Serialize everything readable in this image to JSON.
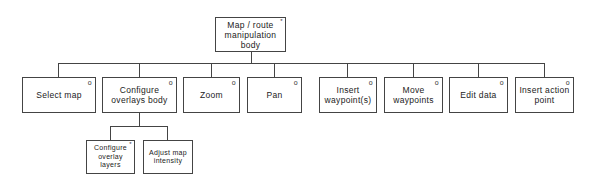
{
  "diagram": {
    "type": "hierarchy-tree",
    "root": {
      "label": "Map / route manipulation body",
      "marker": "*"
    },
    "children": [
      {
        "label": "Select map",
        "marker": "o"
      },
      {
        "label": "Configure overlays body",
        "marker": "o",
        "children": [
          {
            "label": "Configure overlay layers",
            "marker": "*"
          },
          {
            "label": "Adjust map intensity",
            "marker": ""
          }
        ]
      },
      {
        "label": "Zoom",
        "marker": "o"
      },
      {
        "label": "Pan",
        "marker": "o"
      },
      {
        "label": "Insert waypoint(s)",
        "marker": "o"
      },
      {
        "label": "Move waypoints",
        "marker": "o"
      },
      {
        "label": "Edit data",
        "marker": "o"
      },
      {
        "label": "Insert action point",
        "marker": "o"
      }
    ]
  }
}
